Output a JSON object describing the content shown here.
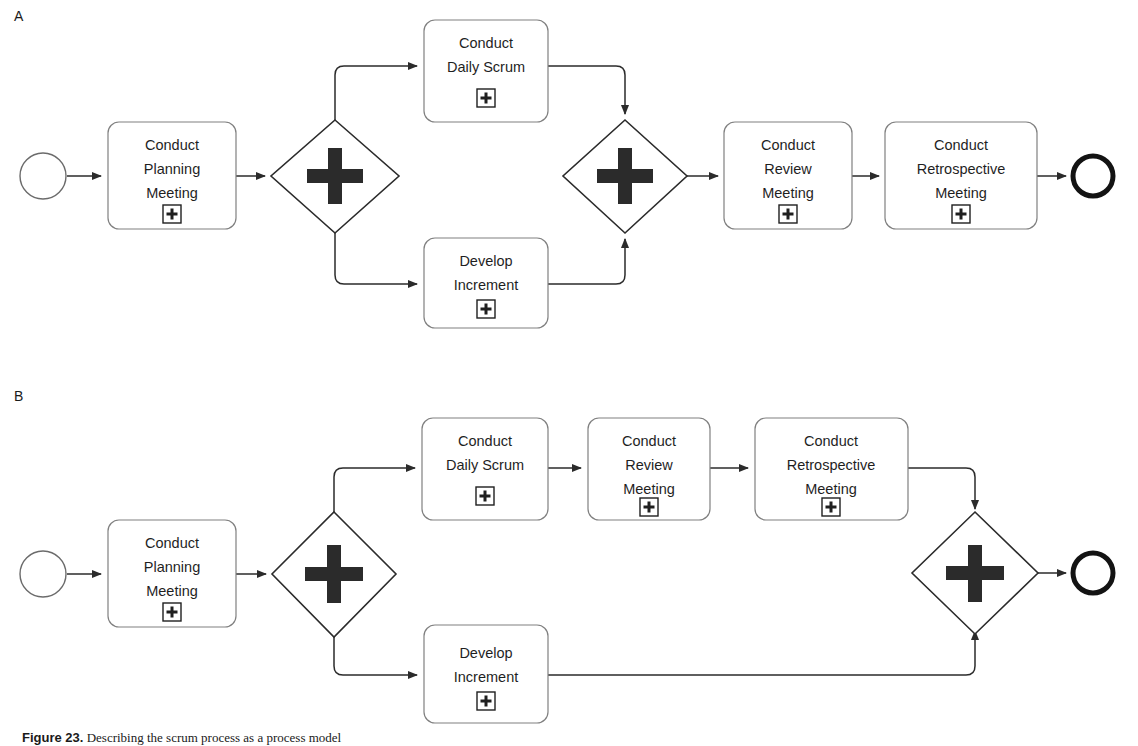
{
  "figure": {
    "panels": [
      {
        "id": "A",
        "label": "A"
      },
      {
        "id": "B",
        "label": "B"
      }
    ],
    "caption_prefix": "Figure 23.",
    "caption_text": "Describing the scrum process as a process model"
  },
  "diagram_a": {
    "panel_label": "A",
    "start_event": {
      "name": "start-event",
      "type": "none-start-event"
    },
    "end_event": {
      "name": "end-event",
      "type": "none-end-event"
    },
    "gateways": [
      {
        "id": "a-split",
        "type": "parallel-gateway",
        "symbol": "+"
      },
      {
        "id": "a-join",
        "type": "parallel-gateway",
        "symbol": "+"
      }
    ],
    "tasks": [
      {
        "id": "a-planning",
        "lines": [
          "Conduct",
          "Planning",
          "Meeting"
        ],
        "marker": "+",
        "marker_type": "sub-process-expand"
      },
      {
        "id": "a-daily-scrum",
        "lines": [
          "Conduct",
          "Daily Scrum"
        ],
        "marker": "+",
        "marker_type": "sub-process-expand"
      },
      {
        "id": "a-develop",
        "lines": [
          "Develop",
          "Increment"
        ],
        "marker": "+",
        "marker_type": "sub-process-expand"
      },
      {
        "id": "a-review",
        "lines": [
          "Conduct",
          "Review",
          "Meeting"
        ],
        "marker": "+",
        "marker_type": "sub-process-expand"
      },
      {
        "id": "a-retrospective",
        "lines": [
          "Conduct",
          "Retrospective",
          "Meeting"
        ],
        "marker": "+",
        "marker_type": "sub-process-expand"
      }
    ]
  },
  "diagram_b": {
    "panel_label": "B",
    "start_event": {
      "name": "start-event",
      "type": "none-start-event"
    },
    "end_event": {
      "name": "end-event",
      "type": "none-end-event"
    },
    "gateways": [
      {
        "id": "b-split",
        "type": "parallel-gateway",
        "symbol": "+"
      },
      {
        "id": "b-join",
        "type": "parallel-gateway",
        "symbol": "+"
      }
    ],
    "tasks": [
      {
        "id": "b-planning",
        "lines": [
          "Conduct",
          "Planning",
          "Meeting"
        ],
        "marker": "+",
        "marker_type": "sub-process-expand"
      },
      {
        "id": "b-daily-scrum",
        "lines": [
          "Conduct",
          "Daily Scrum"
        ],
        "marker": "+",
        "marker_type": "sub-process-expand"
      },
      {
        "id": "b-review",
        "lines": [
          "Conduct",
          "Review",
          "Meeting"
        ],
        "marker": "+",
        "marker_type": "sub-process-expand"
      },
      {
        "id": "b-retrospective",
        "lines": [
          "Conduct",
          "Retrospective",
          "Meeting"
        ],
        "marker": "+",
        "marker_type": "sub-process-expand"
      },
      {
        "id": "b-develop",
        "lines": [
          "Develop",
          "Increment"
        ],
        "marker": "+",
        "marker_type": "sub-process-expand"
      }
    ]
  },
  "text": {
    "conduct": "Conduct",
    "planning": "Planning",
    "meeting": "Meeting",
    "daily_scrum": "Daily Scrum",
    "develop": "Develop",
    "increment": "Increment",
    "review": "Review",
    "retrospective": "Retrospective",
    "plus": "+"
  },
  "colors": {
    "task_border": "#808080",
    "gateway_stroke": "#2b2b2b",
    "flow_stroke": "#2b2b2b",
    "end_event_stroke": "#131313",
    "text": "#1f1f1f",
    "background": "#ffffff"
  }
}
